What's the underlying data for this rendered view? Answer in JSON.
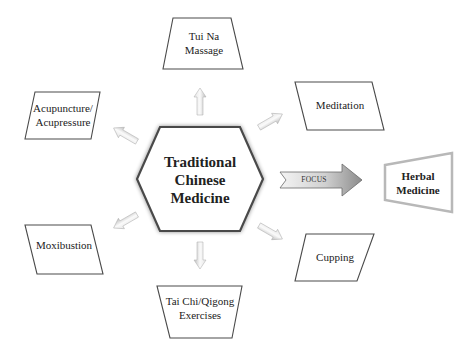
{
  "diagram": {
    "center": {
      "lines": [
        "Traditional",
        "Chinese",
        "Medicine"
      ]
    },
    "nodes": [
      {
        "id": "tui-na",
        "lines": [
          "Tui Na",
          "Massage"
        ]
      },
      {
        "id": "meditation",
        "lines": [
          "Meditation"
        ]
      },
      {
        "id": "cupping",
        "lines": [
          "Cupping"
        ]
      },
      {
        "id": "tai-chi",
        "lines": [
          "Tai Chi/Qigong",
          "Exercises"
        ]
      },
      {
        "id": "moxibustion",
        "lines": [
          "Moxibustion"
        ]
      },
      {
        "id": "acupuncture",
        "lines": [
          "Acupuncture/",
          "Acupressure"
        ]
      }
    ],
    "focus_arrow": {
      "label": "FOCUS"
    },
    "focus_target": {
      "lines": [
        "Herbal",
        "Medicine"
      ]
    }
  },
  "colors": {
    "outline": "#4a4a4a",
    "arrow_fill_light": "#f2f2f2",
    "arrow_fill_dark": "#a8a8a8",
    "herbal_border": "#b0b0b0",
    "text": "#222222"
  }
}
